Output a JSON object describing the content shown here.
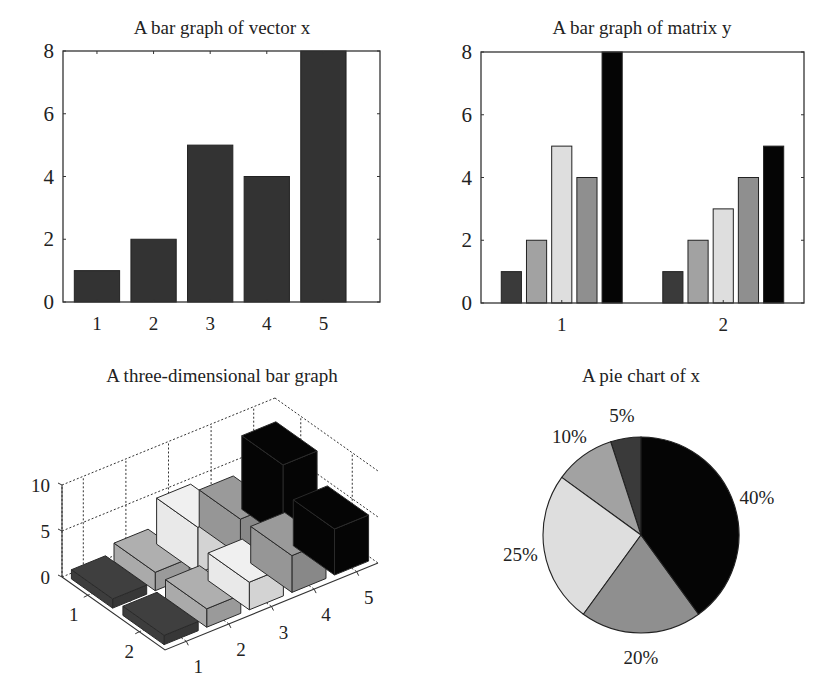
{
  "chart_data": [
    {
      "id": "bar-vector-x",
      "type": "bar",
      "title": "A bar graph of vector x",
      "xlabel": "",
      "ylabel": "",
      "categories": [
        "1",
        "2",
        "3",
        "4",
        "5"
      ],
      "values": [
        1,
        2,
        5,
        4,
        8
      ],
      "ylim": [
        0,
        8
      ],
      "yticks": [
        0,
        2,
        4,
        6,
        8
      ],
      "xlim": [
        0.4,
        6.0
      ],
      "bar_color": "#333333",
      "grid": false
    },
    {
      "id": "bar-matrix-y",
      "type": "bar",
      "title": "A bar graph of matrix y",
      "xlabel": "",
      "ylabel": "",
      "categories": [
        "1",
        "2"
      ],
      "series": [
        {
          "name": "column 1",
          "values": [
            1,
            1
          ],
          "color": "#3a3a3a"
        },
        {
          "name": "column 2",
          "values": [
            2,
            2
          ],
          "color": "#a2a2a2"
        },
        {
          "name": "column 3",
          "values": [
            5,
            3
          ],
          "color": "#dedede"
        },
        {
          "name": "column 4",
          "values": [
            4,
            4
          ],
          "color": "#8f8f8f"
        },
        {
          "name": "column 5",
          "values": [
            8,
            5
          ],
          "color": "#050505"
        }
      ],
      "ylim": [
        0,
        8
      ],
      "yticks": [
        0,
        2,
        4,
        6,
        8
      ],
      "grid": false
    },
    {
      "id": "bar3-matrix",
      "type": "bar",
      "subtype": "bar3",
      "title": "A three-dimensional bar graph",
      "row_labels": [
        "1",
        "2"
      ],
      "column_labels": [
        "1",
        "2",
        "3",
        "4",
        "5"
      ],
      "series": [
        {
          "name": "row 1",
          "values": [
            1,
            2,
            5,
            4,
            8
          ]
        },
        {
          "name": "row 2",
          "values": [
            1,
            2,
            3,
            4,
            5
          ]
        }
      ],
      "column_colors": [
        "#3a3a3a",
        "#a2a2a2",
        "#dedede",
        "#8f8f8f",
        "#050505"
      ],
      "zlim": [
        0,
        10
      ],
      "zticks": [
        0,
        5,
        10
      ],
      "grid": true
    },
    {
      "id": "pie-x",
      "type": "pie",
      "title": "A pie chart of x",
      "labels": [
        "5%",
        "10%",
        "25%",
        "20%",
        "40%"
      ],
      "values": [
        1,
        2,
        5,
        4,
        8
      ],
      "percentages": [
        5,
        10,
        25,
        20,
        40
      ],
      "colors": [
        "#3a3a3a",
        "#a2a2a2",
        "#dedede",
        "#8f8f8f",
        "#050505"
      ]
    }
  ],
  "panels": {
    "top_left": {
      "title": "A bar graph of vector x"
    },
    "top_right": {
      "title": "A bar graph of matrix y"
    },
    "bottom_left": {
      "title": "A three-dimensional bar graph"
    },
    "bottom_right": {
      "title": "A pie chart of x"
    }
  }
}
